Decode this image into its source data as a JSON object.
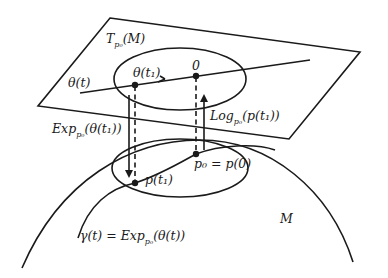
{
  "figure": {
    "type": "exponential-log-map-diagram",
    "labels": {
      "tangent_space": {
        "main": "T",
        "sub": "p₀",
        "rest": "(M)"
      },
      "theta_t": "θ(t)",
      "theta_t1": "θ(t₁)",
      "origin": "0",
      "exp_map": {
        "main": "Exp",
        "sub": "p₀",
        "rest": "(θ(t₁))"
      },
      "log_map": {
        "main": "Log",
        "sub": "p₀",
        "rest": "(p(t₁))"
      },
      "p_t1": "p(t₁)",
      "p0": "p₀ = p(0)",
      "manifold": "M",
      "gamma": {
        "main": "γ(t) = Exp",
        "sub": "p₀",
        "rest": "(θ(t))"
      }
    },
    "colors": {
      "stroke": "#1a1a1a",
      "background": "#ffffff"
    }
  }
}
